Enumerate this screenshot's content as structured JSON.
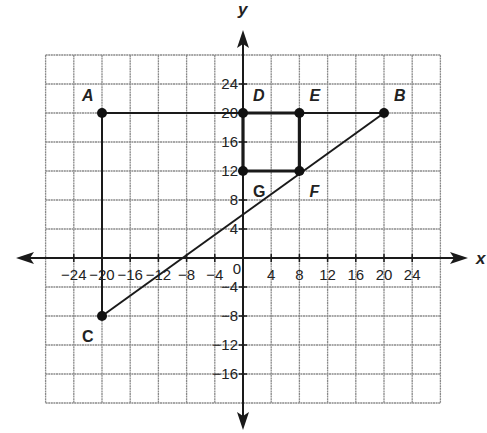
{
  "chart_data": {
    "type": "scatter",
    "title": "",
    "xlabel": "x",
    "ylabel": "y",
    "grid": true,
    "xlim": [
      -28,
      28
    ],
    "ylim": [
      -20,
      28
    ],
    "grid_step": 4,
    "x_ticks": [
      {
        "value": -24,
        "label": "−24"
      },
      {
        "value": -20,
        "label": "−20"
      },
      {
        "value": -16,
        "label": "−16"
      },
      {
        "value": -12,
        "label": "−12"
      },
      {
        "value": -8,
        "label": "−8"
      },
      {
        "value": -4,
        "label": "−4"
      },
      {
        "value": 4,
        "label": "4"
      },
      {
        "value": 8,
        "label": "8"
      },
      {
        "value": 12,
        "label": "12"
      },
      {
        "value": 16,
        "label": "16"
      },
      {
        "value": 20,
        "label": "20"
      },
      {
        "value": 24,
        "label": "24"
      }
    ],
    "y_ticks": [
      {
        "value": 24,
        "label": "24"
      },
      {
        "value": 20,
        "label": "20"
      },
      {
        "value": 16,
        "label": "16"
      },
      {
        "value": 12,
        "label": "12"
      },
      {
        "value": 8,
        "label": "8"
      },
      {
        "value": 4,
        "label": "4"
      },
      {
        "value": -4,
        "label": "−4"
      },
      {
        "value": -8,
        "label": "−8"
      },
      {
        "value": -12,
        "label": "−12"
      },
      {
        "value": -16,
        "label": "−16"
      }
    ],
    "origin_label": "0",
    "points": [
      {
        "name": "A",
        "x": -20,
        "y": 20,
        "label_pos": "top-left",
        "italic": true
      },
      {
        "name": "B",
        "x": 20,
        "y": 20,
        "label_pos": "top-right",
        "italic": true
      },
      {
        "name": "C",
        "x": -20,
        "y": -8,
        "label_pos": "bottom-left",
        "italic": false
      },
      {
        "name": "D",
        "x": 0,
        "y": 20,
        "label_pos": "top-right",
        "italic": true
      },
      {
        "name": "E",
        "x": 8,
        "y": 20,
        "label_pos": "top-right",
        "italic": true
      },
      {
        "name": "F",
        "x": 8,
        "y": 12,
        "label_pos": "bottom-right",
        "italic": true
      },
      {
        "name": "G",
        "x": 0,
        "y": 12,
        "label_pos": "bottom-right",
        "italic": false
      }
    ],
    "segments": [
      {
        "from": "A",
        "to": "B",
        "weight": "normal"
      },
      {
        "from": "A",
        "to": "C",
        "weight": "normal"
      },
      {
        "from": "C",
        "to": "B",
        "weight": "normal"
      },
      {
        "from": "D",
        "to": "E",
        "weight": "thick"
      },
      {
        "from": "E",
        "to": "F",
        "weight": "thick"
      },
      {
        "from": "F",
        "to": "G",
        "weight": "thick"
      },
      {
        "from": "G",
        "to": "D",
        "weight": "thick"
      }
    ]
  }
}
